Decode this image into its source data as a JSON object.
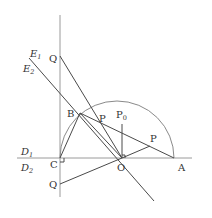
{
  "diagram": {
    "title": "",
    "points": {
      "Q_upper": {
        "label": "Q",
        "x": 60,
        "y": 56
      },
      "Q_lower": {
        "label": "Q",
        "x": 60,
        "y": 184
      },
      "B": {
        "label": "B",
        "x": 80,
        "y": 113
      },
      "C": {
        "label": "C",
        "x": 60,
        "y": 158
      },
      "O": {
        "label": "O",
        "x": 122,
        "y": 158
      },
      "A": {
        "label": "A",
        "x": 174,
        "y": 158
      },
      "P_upper": {
        "label": "P",
        "x": 100,
        "y": 127
      },
      "P0": {
        "label": "P",
        "sub": "0",
        "x": 122,
        "y": 124
      },
      "P_right": {
        "label": "P",
        "x": 150,
        "y": 146
      }
    },
    "lines": {
      "E1": {
        "label": "E",
        "sub": "1"
      },
      "E2": {
        "label": "E",
        "sub": "2"
      },
      "D1": {
        "label": "D",
        "sub": "1"
      },
      "D2": {
        "label": "D",
        "sub": "2"
      }
    },
    "colors": {
      "line": "#4a4a4a",
      "axis": "#9a9a9a",
      "arc": "#8a8a8a",
      "text": "#333333"
    }
  }
}
